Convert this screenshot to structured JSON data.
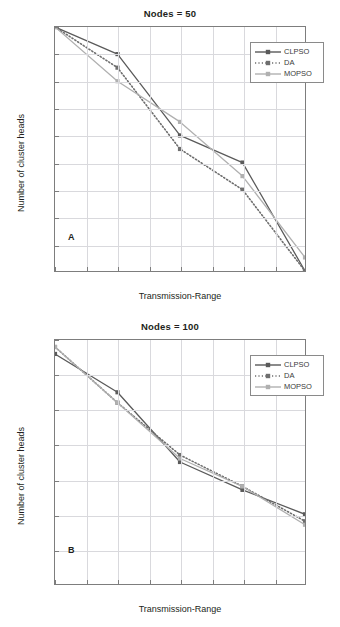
{
  "figure": {
    "axis_y_label": "Number of cluster heads",
    "axis_x_label": "Transmission-Range"
  },
  "panels": [
    {
      "letter": "A",
      "title": "Nodes = 50"
    },
    {
      "letter": "B",
      "title": "Nodes = 100"
    }
  ],
  "legend": {
    "items": [
      {
        "label": "CLPSO",
        "color": "#5a5a5a",
        "style": "solid"
      },
      {
        "label": "DA",
        "color": "#6e6e6e",
        "style": "dotted"
      },
      {
        "label": "MOPSO",
        "color": "#b0b0b0",
        "style": "solid"
      }
    ]
  },
  "chart_data": [
    {
      "type": "line",
      "title": "Nodes = 50",
      "panel": "A",
      "xlabel": "Transmission-Range",
      "ylabel": "Number of cluster heads",
      "x": [
        2,
        4,
        6,
        8,
        10
      ],
      "xlim": [
        2,
        10
      ],
      "ylim": [
        32,
        50
      ],
      "xticks": [
        2,
        3,
        4,
        5,
        6,
        7,
        8,
        9,
        10
      ],
      "yticks": [
        32,
        34,
        36,
        38,
        40,
        42,
        44,
        46,
        48,
        50
      ],
      "grid": true,
      "legend_position": "upper right",
      "series": [
        {
          "name": "CLPSO",
          "values": [
            50,
            48,
            42,
            40,
            32
          ]
        },
        {
          "name": "DA",
          "values": [
            50,
            47,
            41,
            38,
            32
          ]
        },
        {
          "name": "MOPSO",
          "values": [
            50,
            46,
            43,
            39,
            33
          ]
        }
      ]
    },
    {
      "type": "line",
      "title": "Nodes = 100",
      "panel": "B",
      "xlabel": "Transmission-Range",
      "ylabel": "Number of cluster heads",
      "x": [
        2,
        4,
        6,
        8,
        10
      ],
      "xlim": [
        2,
        10
      ],
      "ylim": [
        30,
        100
      ],
      "xticks": [
        2,
        3,
        4,
        5,
        6,
        7,
        8,
        9,
        10
      ],
      "yticks": [
        30,
        40,
        50,
        60,
        70,
        80,
        90,
        100
      ],
      "grid": true,
      "legend_position": "upper right",
      "series": [
        {
          "name": "CLPSO",
          "values": [
            96,
            85,
            65,
            57,
            50
          ]
        },
        {
          "name": "DA",
          "values": [
            98,
            82,
            67,
            58,
            48
          ]
        },
        {
          "name": "MOPSO",
          "values": [
            98,
            82,
            66,
            58,
            47
          ]
        }
      ]
    }
  ]
}
